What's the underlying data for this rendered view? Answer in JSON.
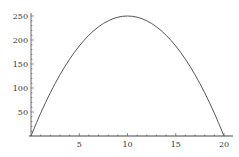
{
  "chart_data": {
    "type": "line",
    "title": "",
    "xlabel": "",
    "ylabel": "",
    "xlim": [
      0,
      20.5
    ],
    "ylim": [
      0,
      255
    ],
    "grid": false,
    "legend": null,
    "x_ticks": [
      5,
      10,
      15,
      20
    ],
    "x_tick_labels": [
      "5",
      "10",
      "15",
      "20"
    ],
    "y_ticks": [
      50,
      100,
      150,
      200,
      250
    ],
    "y_tick_labels": [
      "50",
      "100",
      "150",
      "200",
      "250"
    ],
    "series": [
      {
        "name": "curve",
        "x": [
          0,
          1,
          2,
          3,
          4,
          5,
          6,
          7,
          8,
          9,
          10,
          11,
          12,
          13,
          14,
          15,
          16,
          17,
          18,
          19,
          20
        ],
        "values": [
          0,
          47.5,
          90,
          127.5,
          160,
          187.5,
          210,
          227.5,
          240,
          247.5,
          250,
          247.5,
          240,
          227.5,
          210,
          187.5,
          160,
          127.5,
          90,
          47.5,
          0
        ]
      }
    ]
  },
  "axes": {
    "x_labels": [
      "5",
      "10",
      "15",
      "20"
    ],
    "y_labels": [
      "50",
      "100",
      "150",
      "200",
      "250"
    ]
  }
}
